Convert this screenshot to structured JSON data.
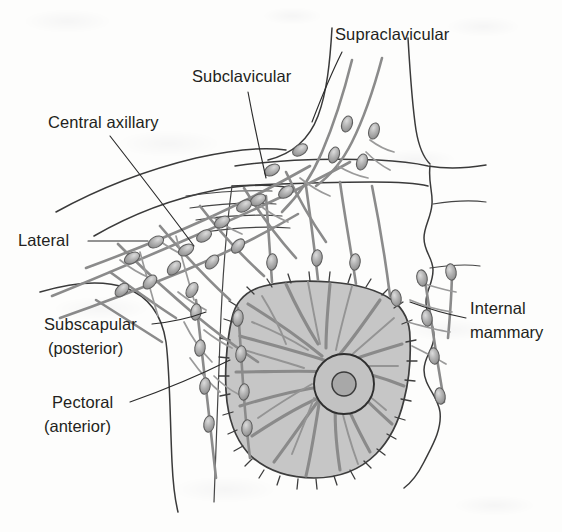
{
  "figure": {
    "background_color": "#fdfdfc"
  },
  "palette": {
    "outline": "#3a3a3a",
    "leader": "#2b2b2b",
    "vessel": "#8b8b8b",
    "breast_fill": "#c6c6c6",
    "node_fill": "#b0b0b0",
    "label_text": "#231f20"
  },
  "labels": [
    {
      "id": "supraclavicular",
      "name": "Supraclavicular",
      "line1": "Supraclavicular",
      "line2": "",
      "x": 335,
      "y": 40,
      "anchor": "start"
    },
    {
      "id": "subclavicular",
      "name": "Subclavicular",
      "line1": "Subclavicular",
      "line2": "",
      "x": 192,
      "y": 82,
      "anchor": "start"
    },
    {
      "id": "central-axillary",
      "name": "Central axillary",
      "line1": "Central axillary",
      "line2": "",
      "x": 48,
      "y": 128,
      "anchor": "start"
    },
    {
      "id": "lateral",
      "name": "Lateral",
      "line1": "Lateral",
      "line2": "",
      "x": 18,
      "y": 246,
      "anchor": "start"
    },
    {
      "id": "subscapular",
      "name": "Subscapular (posterior)",
      "line1": "Subscapular",
      "line2": "(posterior)",
      "x": 44,
      "y": 330,
      "anchor": "start"
    },
    {
      "id": "pectoral",
      "name": "Pectoral (anterior)",
      "line1": "Pectoral",
      "line2": "(anterior)",
      "x": 44,
      "y": 408,
      "anchor": "start"
    },
    {
      "id": "internal-mammary",
      "name": "Internal mammary",
      "line1": "Internal",
      "line2": "mammary",
      "x": 470,
      "y": 314,
      "anchor": "start"
    }
  ],
  "anatomy": {
    "breast": {
      "name": "breast-mound",
      "areola_label": "areola",
      "nipple_label": "nipple"
    },
    "node_groups": [
      "supraclavicular",
      "subclavicular",
      "central-axillary",
      "lateral",
      "subscapular",
      "pectoral",
      "internal-mammary"
    ]
  }
}
